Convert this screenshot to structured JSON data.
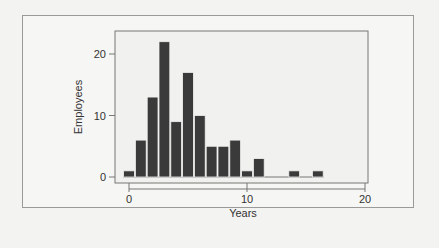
{
  "chart_data": {
    "type": "bar",
    "title": "",
    "xlabel": "Years",
    "ylabel": "Employees",
    "xlim": [
      -1,
      20
    ],
    "ylim": [
      0,
      23
    ],
    "x_ticks": [
      0,
      10,
      20
    ],
    "y_ticks": [
      0,
      10,
      20
    ],
    "bin_width": 1,
    "bins": [
      0,
      1,
      2,
      3,
      4,
      5,
      6,
      7,
      8,
      9,
      10,
      11,
      12,
      13,
      14,
      15,
      16
    ],
    "values": [
      1,
      6,
      13,
      22,
      9,
      17,
      10,
      5,
      5,
      6,
      1,
      3,
      0,
      0,
      1,
      0,
      1
    ],
    "bar_color": "#3a3a3a",
    "grid": false,
    "legend": null
  }
}
